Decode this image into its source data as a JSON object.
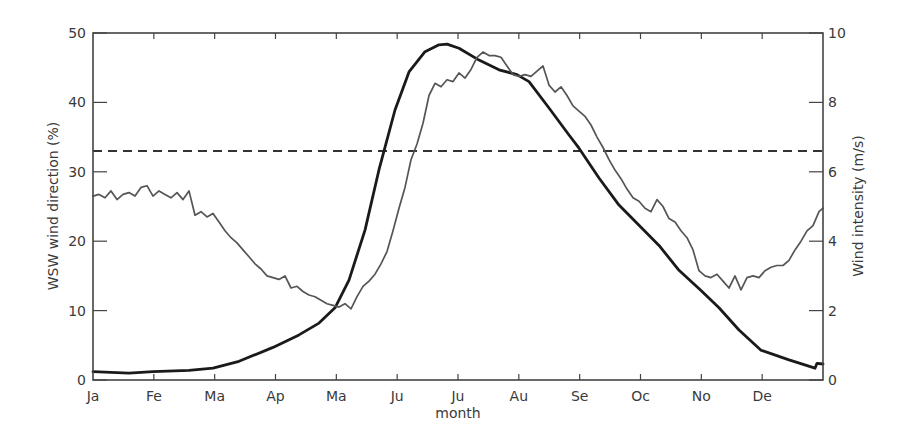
{
  "chart_data": {
    "type": "line",
    "title": "",
    "xlabel": "month",
    "ylabel": "WSW wind direction (%)",
    "y2label": "Wind intensity (m/s)",
    "x_ticks": [
      "Ja",
      "Fe",
      "Ma",
      "Ap",
      "Ma",
      "Ju",
      "Ju",
      "Au",
      "Se",
      "Oc",
      "No",
      "De"
    ],
    "x_range_days": [
      0,
      365
    ],
    "ylim": [
      0,
      50
    ],
    "y_ticks": [
      0,
      10,
      20,
      30,
      40,
      50
    ],
    "y2lim": [
      0,
      10
    ],
    "y2_ticks": [
      0,
      2,
      4,
      6,
      8,
      10
    ],
    "grid": false,
    "legend": null,
    "reference_line": {
      "name": "threshold (dashed)",
      "axis": "left",
      "value": 33,
      "style": "dashed"
    },
    "series": [
      {
        "name": "WSW wind direction (%)",
        "axis": "left",
        "style": "thick",
        "color": "#1a1a1a",
        "x_day": [
          0,
          18,
          30,
          48,
          60,
          73,
          90,
          103,
          113,
          121,
          128,
          136,
          143,
          151,
          158,
          166,
          173,
          177,
          183,
          193,
          203,
          212,
          218,
          228,
          238,
          243,
          253,
          263,
          273,
          283,
          293,
          304,
          313,
          323,
          334,
          348,
          361,
          362,
          365
        ],
        "values": [
          1.2,
          1.0,
          1.2,
          1.4,
          1.7,
          2.7,
          4.7,
          6.5,
          8.2,
          10.4,
          14.4,
          21.6,
          30.3,
          38.9,
          44.4,
          47.3,
          48.3,
          48.4,
          47.8,
          46.1,
          44.7,
          44.0,
          43.0,
          39.2,
          35.3,
          33.4,
          29.1,
          25.2,
          22.3,
          19.4,
          15.8,
          12.9,
          10.4,
          7.2,
          4.3,
          2.9,
          1.7,
          2.4,
          2.3
        ]
      },
      {
        "name": "Wind intensity (m/s)",
        "axis": "right",
        "style": "thin",
        "color": "#555555",
        "x_day": [
          0,
          3,
          6,
          9,
          12,
          15,
          18,
          21,
          24,
          27,
          30,
          33,
          36,
          39,
          42,
          45,
          48,
          51,
          54,
          57,
          60,
          63,
          66,
          69,
          72,
          75,
          78,
          81,
          84,
          87,
          90,
          93,
          96,
          99,
          102,
          105,
          108,
          111,
          114,
          117,
          120,
          123,
          126,
          129,
          132,
          135,
          138,
          141,
          144,
          147,
          150,
          153,
          156,
          159,
          162,
          165,
          168,
          171,
          174,
          177,
          180,
          183,
          186,
          189,
          192,
          195,
          198,
          201,
          204,
          207,
          210,
          213,
          216,
          219,
          222,
          225,
          228,
          231,
          234,
          237,
          240,
          243,
          246,
          249,
          252,
          255,
          258,
          261,
          264,
          267,
          270,
          273,
          276,
          279,
          282,
          285,
          288,
          291,
          294,
          297,
          300,
          303,
          306,
          309,
          312,
          315,
          318,
          321,
          324,
          327,
          330,
          333,
          336,
          339,
          342,
          345,
          348,
          351,
          354,
          357,
          360,
          363,
          365
        ],
        "values": [
          5.3,
          5.35,
          5.25,
          5.45,
          5.2,
          5.35,
          5.4,
          5.3,
          5.55,
          5.6,
          5.3,
          5.45,
          5.35,
          5.25,
          5.4,
          5.2,
          5.45,
          4.75,
          4.85,
          4.7,
          4.8,
          4.55,
          4.3,
          4.1,
          3.95,
          3.75,
          3.55,
          3.35,
          3.2,
          3.0,
          2.95,
          2.9,
          3.0,
          2.65,
          2.7,
          2.55,
          2.45,
          2.4,
          2.3,
          2.2,
          2.15,
          2.1,
          2.2,
          2.05,
          2.4,
          2.7,
          2.85,
          3.05,
          3.35,
          3.7,
          4.3,
          4.95,
          5.55,
          6.35,
          6.8,
          7.4,
          8.2,
          8.55,
          8.45,
          8.65,
          8.6,
          8.85,
          8.7,
          8.95,
          9.3,
          9.45,
          9.35,
          9.35,
          9.3,
          9.05,
          8.8,
          8.75,
          8.8,
          8.75,
          8.9,
          9.05,
          8.5,
          8.3,
          8.45,
          8.2,
          7.9,
          7.75,
          7.6,
          7.35,
          7.0,
          6.7,
          6.35,
          6.05,
          5.8,
          5.5,
          5.25,
          5.15,
          4.95,
          4.85,
          5.2,
          5.0,
          4.65,
          4.55,
          4.3,
          4.1,
          3.75,
          3.15,
          3.0,
          2.95,
          3.05,
          2.85,
          2.65,
          3.0,
          2.6,
          2.95,
          3.0,
          2.95,
          3.15,
          3.25,
          3.3,
          3.3,
          3.45,
          3.75,
          4.0,
          4.3,
          4.45,
          4.85,
          4.95,
          4.8
        ]
      }
    ]
  }
}
